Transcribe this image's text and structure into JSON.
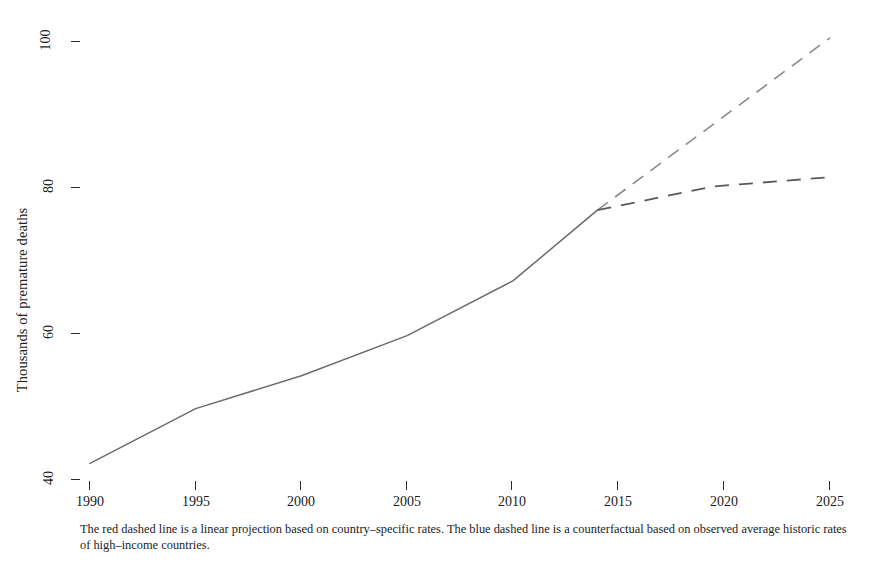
{
  "chart_data": {
    "type": "line",
    "title": "",
    "subtitle": "",
    "xlabel": "",
    "ylabel": "Thousands of premature deaths",
    "xlim": [
      1990,
      2025
    ],
    "ylim": [
      40,
      100
    ],
    "x_ticks": [
      1990,
      1995,
      2000,
      2005,
      2010,
      2015,
      2020,
      2025
    ],
    "y_ticks": [
      40,
      60,
      80,
      100
    ],
    "grid": false,
    "legend": "none",
    "series": [
      {
        "name": "Observed premature deaths",
        "style": "solid",
        "color": "#6b6b6b",
        "x": [
          1990,
          1995,
          2000,
          2005,
          2010,
          2014
        ],
        "values": [
          42.0,
          49.5,
          54.0,
          59.5,
          67.0,
          76.7
        ]
      },
      {
        "name": "Linear projection based on country-specific rates",
        "style": "dashed",
        "color": "#8a8a8a",
        "x": [
          2014,
          2025
        ],
        "values": [
          76.7,
          100.3
        ]
      },
      {
        "name": "Counterfactual based on high-income country rates",
        "style": "dashed",
        "color": "#5a5a5a",
        "x": [
          2014,
          2025
        ],
        "values": [
          76.7,
          81.2
        ]
      }
    ],
    "annotations": [
      "The red dashed line is a linear projection based on country-specific rates. The blue dashed line is a counterfactual based on observed average historic rates of high-income countries."
    ]
  },
  "axes": {
    "y_title": "Thousands of premature deaths",
    "y_tick_labels": [
      "40",
      "60",
      "80",
      "100"
    ],
    "x_tick_labels": [
      "1990",
      "1995",
      "2000",
      "2005",
      "2010",
      "2015",
      "2020",
      "2025"
    ]
  },
  "caption": {
    "text": "The red dashed line is a linear projection based on country–specific rates. The blue dashed line is a counterfactual based on observed average historic rates of high–income countries."
  },
  "colors": {
    "background": "#ffffff",
    "axis": "#2a2a2a",
    "observed_line": "#6b6b6b",
    "projection_line": "#8a8a8a",
    "counterfactual_line": "#5a5a5a",
    "text": "#1a1a1a"
  }
}
